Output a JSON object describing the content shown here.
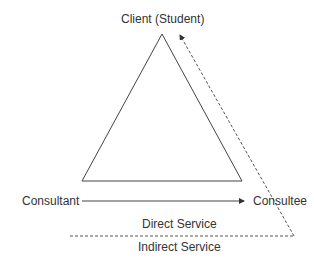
{
  "diagram": {
    "nodes": {
      "client": "Client (Student)",
      "consultant": "Consultant",
      "consultee": "Consultee"
    },
    "regions": {
      "direct": "Direct Service",
      "indirect": "Indirect Service"
    },
    "colors": {
      "line": "#444444",
      "text": "#333333"
    }
  }
}
